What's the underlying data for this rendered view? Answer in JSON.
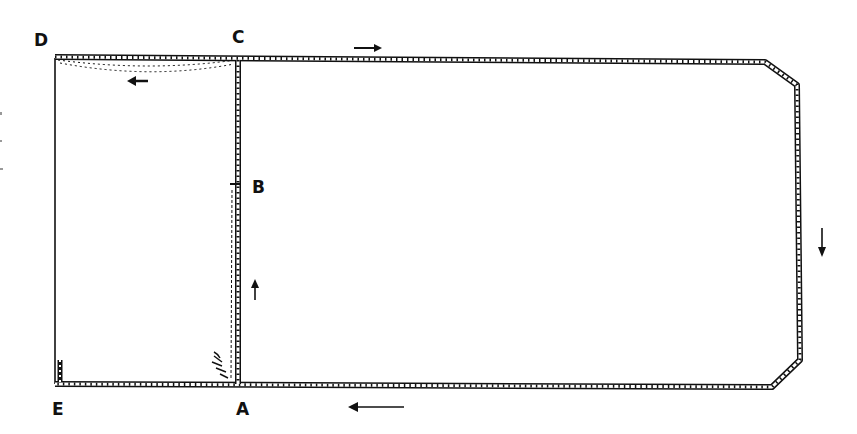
{
  "diagram": {
    "type": "rope/cord stitching path diagram",
    "points": [
      {
        "id": "D",
        "label": "D",
        "x": 40,
        "y": 46
      },
      {
        "id": "C",
        "label": "C",
        "x": 240,
        "y": 42
      },
      {
        "id": "B",
        "label": "B",
        "x": 259,
        "y": 192
      },
      {
        "id": "E",
        "label": "E",
        "x": 58,
        "y": 414
      },
      {
        "id": "A",
        "label": "A",
        "x": 242,
        "y": 414
      }
    ],
    "arrows": [
      {
        "id": "top-right-arrow",
        "direction": "right"
      },
      {
        "id": "top-left-arrow",
        "direction": "left"
      },
      {
        "id": "center-up-arrow",
        "direction": "up"
      },
      {
        "id": "right-down-arrow",
        "direction": "down"
      },
      {
        "id": "bottom-left-arrow",
        "direction": "left"
      }
    ],
    "colors": {
      "ink": "#111111",
      "paper": "#ffffff"
    }
  }
}
